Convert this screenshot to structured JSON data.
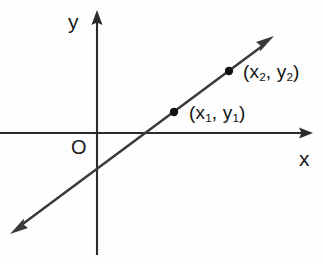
{
  "figure": {
    "kind": "line-on-coordinate-plane",
    "background_color": "#fefefe",
    "stroke_color": "#2b2b2b",
    "text_color": "#1a1a1a",
    "width": 323,
    "height": 264
  },
  "axes": {
    "x": {
      "label": "x",
      "label_position": {
        "x": 299,
        "y": 148
      },
      "line": {
        "x1": 0,
        "y1": 133,
        "x2": 306,
        "y2": 133
      },
      "arrow_at": "right",
      "arrow_tip": {
        "x": 312,
        "y": 133
      }
    },
    "y": {
      "label": "y",
      "label_position": {
        "x": 68,
        "y": 11
      },
      "line": {
        "x1": 97,
        "y1": 18,
        "x2": 97,
        "y2": 255
      },
      "arrow_at": "top",
      "arrow_tip": {
        "x": 97,
        "y": 11
      }
    },
    "origin": {
      "label": "O",
      "position": {
        "x": 97,
        "y": 133
      },
      "label_position": {
        "x": 71,
        "y": 137
      }
    }
  },
  "line": {
    "start": {
      "x": 12,
      "y": 232
    },
    "end": {
      "x": 272,
      "y": 38
    },
    "arrows": "both",
    "x_intercept": {
      "x": 143,
      "y": 133
    },
    "y_intercept": {
      "x": 97,
      "y": 167
    },
    "stroke_width": 2.4
  },
  "points": [
    {
      "id": "point-1",
      "label_text": "(x1, y1)",
      "label_prefix": "(x",
      "label_sub1": "1",
      "label_mid": ", y",
      "label_sub2": "1",
      "label_suffix": ")",
      "marker": {
        "x": 174,
        "y": 112,
        "radius": 4.2
      },
      "label_position": {
        "x": 189,
        "y": 103
      }
    },
    {
      "id": "point-2",
      "label_text": "(x2, y2)",
      "label_prefix": "(x",
      "label_sub1": "2",
      "label_mid": ", y",
      "label_sub2": "2",
      "label_suffix": ")",
      "marker": {
        "x": 229,
        "y": 71,
        "radius": 4.2
      },
      "label_position": {
        "x": 243,
        "y": 62
      }
    }
  ]
}
